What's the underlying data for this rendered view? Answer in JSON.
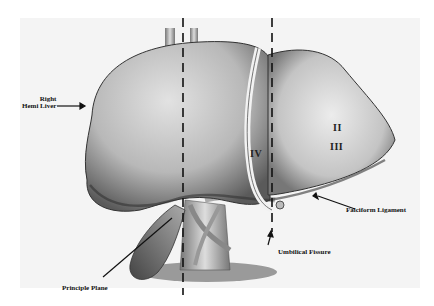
{
  "figure": {
    "labels": {
      "right_hemi_liver_line1": "Right",
      "right_hemi_liver_line2": "Hemi Liver",
      "falciform_ligament": "Falciform Ligament",
      "umbilical_fissure": "Umbilical Fissure",
      "principle_plane": "Principle Plane"
    },
    "segments": {
      "iv": "IV",
      "ii": "II",
      "iii": "III"
    },
    "colors": {
      "background": "#f4f4f4",
      "liver_light": "#cfcfcf",
      "liver_dark": "#6a6a6a",
      "ink": "#111111"
    }
  }
}
